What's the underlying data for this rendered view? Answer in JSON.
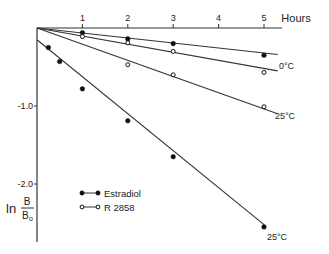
{
  "chart_data": {
    "type": "line",
    "title": "",
    "xlabel": "Hours",
    "ylabel": "ln B/Bo",
    "ylabel_parts": {
      "prefix": "ln",
      "numerator": "B",
      "denominator": "Bo"
    },
    "x_ticks": [
      "1",
      "2",
      "3",
      "4",
      "5"
    ],
    "y_ticks": [
      "-1.0",
      "-2.0"
    ],
    "xlim": [
      0,
      5.3
    ],
    "ylim": [
      -2.7,
      0
    ],
    "grid": false,
    "legend": [
      {
        "label": "Estradiol",
        "marker": "filled-circle"
      },
      {
        "label": "R 2858",
        "marker": "open-circle"
      }
    ],
    "series": [
      {
        "name": "Estradiol",
        "condition": "0°C",
        "marker": "filled",
        "x": [
          1,
          2,
          3,
          5
        ],
        "y": [
          -0.06,
          -0.14,
          -0.2,
          -0.35
        ],
        "fit_end": [
          5.3,
          -0.34
        ]
      },
      {
        "name": "R 2858",
        "condition": "0°C",
        "marker": "open",
        "x": [
          1,
          2,
          3,
          5
        ],
        "y": [
          -0.11,
          -0.19,
          -0.3,
          -0.57
        ],
        "fit_end": [
          5.3,
          -0.55
        ]
      },
      {
        "name": "R 2858",
        "condition": "25°C",
        "marker": "open",
        "x": [
          2,
          3,
          5
        ],
        "y": [
          -0.47,
          -0.6,
          -1.01
        ],
        "fit_end": [
          5.3,
          -1.1
        ]
      },
      {
        "name": "Estradiol",
        "condition": "25°C",
        "marker": "filled",
        "x": [
          0.25,
          0.5,
          1,
          2,
          3,
          5
        ],
        "y": [
          -0.25,
          -0.43,
          -0.78,
          -1.19,
          -1.65,
          -2.55
        ],
        "fit_start": [
          0,
          -0.15
        ],
        "fit_end": [
          5.0,
          -2.52
        ]
      }
    ],
    "annotations": [
      {
        "text": "0°C",
        "near": "0°C lines end"
      },
      {
        "text": "25°C",
        "near": "R 2858 25°C line end"
      },
      {
        "text": "25°C",
        "near": "Estradiol 25°C line end"
      }
    ]
  }
}
